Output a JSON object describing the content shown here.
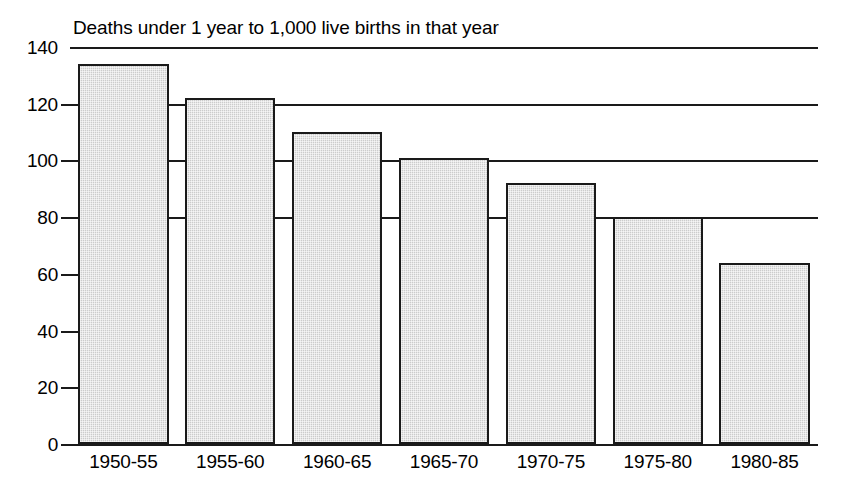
{
  "chart_data": {
    "type": "bar",
    "title": "Deaths under 1 year to 1,000 live births in that year",
    "xlabel": "",
    "ylabel": "",
    "categories": [
      "1950-55",
      "1955-60",
      "1960-65",
      "1965-70",
      "1970-75",
      "1975-80",
      "1980-85"
    ],
    "values": [
      134,
      122,
      110,
      101,
      92,
      80,
      64
    ],
    "ylim": [
      0,
      140
    ],
    "yticks": [
      0,
      20,
      40,
      60,
      80,
      100,
      120,
      140
    ],
    "ytick_labels": [
      "0",
      "20",
      "40",
      "60",
      "80",
      "100",
      "120",
      "140"
    ],
    "grid": "horizontal gridlines at 80, 100, 120, 140; short ticks at 0, 20, 40, 60",
    "gridline_values": [
      80,
      100,
      120,
      140
    ],
    "tickonly_values": [
      0,
      20,
      40,
      60
    ],
    "legend": null,
    "legend_position": "none",
    "bar_fill_color": "#cccccc",
    "bar_edge_color": "#1a1a1a",
    "axis_color": "#1a1a1a",
    "background_color": "#ffffff"
  },
  "figure": {
    "width": 841,
    "height": 486
  }
}
